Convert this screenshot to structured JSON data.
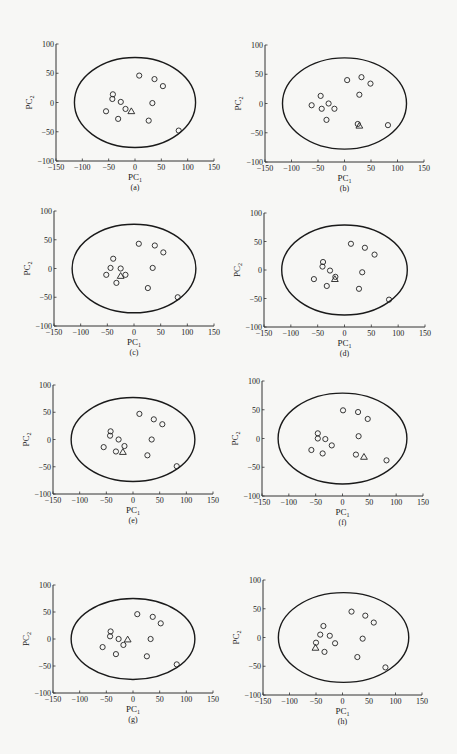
{
  "chart_data": [
    {
      "type": "scatter",
      "panel": "a",
      "caption": "(a)",
      "xlabel": "PC",
      "xlabel_sub": "1",
      "ylabel": "PC",
      "ylabel_sub": "2",
      "xlim": [
        -150,
        150
      ],
      "ylim": [
        -100,
        100
      ],
      "xticks": [
        -150,
        -100,
        -50,
        0,
        50,
        100,
        150
      ],
      "yticks": [
        -100,
        -50,
        0,
        50,
        100
      ],
      "ellipse": {
        "cx": 0,
        "cy": 0,
        "rx": 115,
        "ry": 77
      },
      "series": [
        {
          "name": "circles",
          "marker": "circle",
          "points": [
            [
              8,
              46
            ],
            [
              37,
              40
            ],
            [
              53,
              28
            ],
            [
              -42,
              14
            ],
            [
              -43,
              6
            ],
            [
              -27,
              1
            ],
            [
              33,
              -1
            ],
            [
              -55,
              -15
            ],
            [
              -18,
              -11
            ],
            [
              -32,
              -28
            ],
            [
              26,
              -31
            ],
            [
              83,
              -48
            ]
          ]
        },
        {
          "name": "triangle",
          "marker": "triangle",
          "points": [
            [
              -7,
              -15
            ]
          ]
        }
      ]
    },
    {
      "type": "scatter",
      "panel": "b",
      "caption": "(b)",
      "xlabel": "PC",
      "xlabel_sub": "1",
      "ylabel": "PC",
      "ylabel_sub": "2",
      "xlim": [
        -150,
        150
      ],
      "ylim": [
        -100,
        100
      ],
      "xticks": [
        -150,
        -100,
        -50,
        0,
        50,
        100,
        150
      ],
      "yticks": [
        -100,
        -50,
        0,
        50,
        100
      ],
      "ellipse": {
        "cx": 0,
        "cy": 0,
        "rx": 117,
        "ry": 78
      },
      "series": [
        {
          "name": "circles",
          "marker": "circle",
          "points": [
            [
              5,
              40
            ],
            [
              32,
              45
            ],
            [
              49,
              34
            ],
            [
              -45,
              13
            ],
            [
              28,
              15
            ],
            [
              -62,
              -3
            ],
            [
              -43,
              -9
            ],
            [
              -30,
              0
            ],
            [
              -19,
              -9
            ],
            [
              -34,
              -28
            ],
            [
              25,
              -35
            ],
            [
              82,
              -37
            ]
          ]
        },
        {
          "name": "triangle",
          "marker": "triangle",
          "points": [
            [
              28,
              -38
            ]
          ]
        }
      ]
    },
    {
      "type": "scatter",
      "panel": "c",
      "caption": "(c)",
      "xlabel": "PC",
      "xlabel_sub": "1",
      "ylabel": "PC",
      "ylabel_sub": "2",
      "xlim": [
        -150,
        150
      ],
      "ylim": [
        -100,
        100
      ],
      "xticks": [
        -150,
        -100,
        -50,
        0,
        50,
        100,
        150
      ],
      "yticks": [
        -100,
        -50,
        0,
        50,
        100
      ],
      "ellipse": {
        "cx": 0,
        "cy": 0,
        "rx": 116,
        "ry": 77
      },
      "series": [
        {
          "name": "circles",
          "marker": "circle",
          "points": [
            [
              9,
              43
            ],
            [
              39,
              40
            ],
            [
              55,
              28
            ],
            [
              -39,
              17
            ],
            [
              -44,
              1
            ],
            [
              -25,
              0
            ],
            [
              35,
              1
            ],
            [
              -52,
              -11
            ],
            [
              -16,
              -11
            ],
            [
              -33,
              -25
            ],
            [
              26,
              -34
            ],
            [
              82,
              -50
            ]
          ]
        },
        {
          "name": "triangle",
          "marker": "triangle",
          "points": [
            [
              -25,
              -13
            ]
          ]
        }
      ]
    },
    {
      "type": "scatter",
      "panel": "d",
      "caption": "(d)",
      "xlabel": "PC",
      "xlabel_sub": "1",
      "ylabel": "PC",
      "ylabel_sub": "2",
      "xlim": [
        -150,
        150
      ],
      "ylim": [
        -100,
        100
      ],
      "xticks": [
        -150,
        -100,
        -50,
        0,
        50,
        100,
        150
      ],
      "yticks": [
        -100,
        -50,
        0,
        50,
        100
      ],
      "ellipse": {
        "cx": 0,
        "cy": 0,
        "rx": 117,
        "ry": 79
      },
      "series": [
        {
          "name": "circles",
          "marker": "circle",
          "points": [
            [
              12,
              46
            ],
            [
              38,
              39
            ],
            [
              56,
              27
            ],
            [
              -40,
              14
            ],
            [
              -41,
              6
            ],
            [
              -27,
              -1
            ],
            [
              33,
              -4
            ],
            [
              -57,
              -16
            ],
            [
              -17,
              -12
            ],
            [
              -33,
              -28
            ],
            [
              27,
              -33
            ],
            [
              83,
              -52
            ]
          ]
        },
        {
          "name": "triangle",
          "marker": "triangle",
          "points": [
            [
              -18,
              -16
            ]
          ]
        }
      ]
    },
    {
      "type": "scatter",
      "panel": "e",
      "caption": "(e)",
      "xlabel": "PC",
      "xlabel_sub": "1",
      "ylabel": "PC",
      "ylabel_sub": "2",
      "xlim": [
        -150,
        150
      ],
      "ylim": [
        -100,
        100
      ],
      "xticks": [
        -150,
        -100,
        -50,
        0,
        50,
        100,
        150
      ],
      "yticks": [
        -100,
        -50,
        0,
        50,
        100
      ],
      "ellipse": {
        "cx": 0,
        "cy": 0,
        "rx": 116,
        "ry": 77
      },
      "series": [
        {
          "name": "circles",
          "marker": "circle",
          "points": [
            [
              12,
              47
            ],
            [
              39,
              37
            ],
            [
              55,
              28
            ],
            [
              -42,
              15
            ],
            [
              -43,
              7
            ],
            [
              -27,
              0
            ],
            [
              35,
              0
            ],
            [
              -55,
              -14
            ],
            [
              -16,
              -12
            ],
            [
              -32,
              -22
            ],
            [
              27,
              -29
            ],
            [
              82,
              -49
            ]
          ]
        },
        {
          "name": "triangle",
          "marker": "triangle",
          "points": [
            [
              -19,
              -23
            ]
          ]
        }
      ]
    },
    {
      "type": "scatter",
      "panel": "f",
      "caption": "(f)",
      "xlabel": "PC",
      "xlabel_sub": "1",
      "ylabel": "PC",
      "ylabel_sub": "2",
      "xlim": [
        -150,
        150
      ],
      "ylim": [
        -100,
        100
      ],
      "xticks": [
        -150,
        -100,
        -50,
        0,
        50,
        100,
        150
      ],
      "yticks": [
        -100,
        -50,
        0,
        50,
        100
      ],
      "ellipse": {
        "cx": 0,
        "cy": 0,
        "rx": 120,
        "ry": 79
      },
      "series": [
        {
          "name": "circles",
          "marker": "circle",
          "points": [
            [
              1,
              49
            ],
            [
              29,
              46
            ],
            [
              47,
              34
            ],
            [
              -46,
              9
            ],
            [
              -46,
              0
            ],
            [
              -32,
              -1
            ],
            [
              30,
              4
            ],
            [
              -58,
              -20
            ],
            [
              -20,
              -12
            ],
            [
              -37,
              -26
            ],
            [
              25,
              -28
            ],
            [
              82,
              -38
            ]
          ]
        },
        {
          "name": "triangle",
          "marker": "triangle",
          "points": [
            [
              40,
              -32
            ]
          ]
        }
      ]
    },
    {
      "type": "scatter",
      "panel": "g",
      "caption": "(g)",
      "xlabel": "PC",
      "xlabel_sub": "1",
      "ylabel": "PC",
      "ylabel_sub": "2",
      "xlim": [
        -150,
        150
      ],
      "ylim": [
        -100,
        100
      ],
      "xticks": [
        -150,
        -100,
        -50,
        0,
        50,
        100,
        150
      ],
      "yticks": [
        -100,
        -50,
        0,
        50,
        100
      ],
      "ellipse": {
        "cx": 0,
        "cy": 0,
        "rx": 116,
        "ry": 75
      },
      "series": [
        {
          "name": "circles",
          "marker": "circle",
          "points": [
            [
              8,
              46
            ],
            [
              37,
              41
            ],
            [
              52,
              29
            ],
            [
              -42,
              14
            ],
            [
              -43,
              5
            ],
            [
              -27,
              0
            ],
            [
              33,
              0
            ],
            [
              -57,
              -15
            ],
            [
              -18,
              -11
            ],
            [
              -32,
              -28
            ],
            [
              26,
              -32
            ],
            [
              82,
              -47
            ]
          ]
        },
        {
          "name": "triangle",
          "marker": "triangle",
          "points": [
            [
              -10,
              -1
            ]
          ]
        }
      ]
    },
    {
      "type": "scatter",
      "panel": "h",
      "caption": "(h)",
      "xlabel": "PC",
      "xlabel_sub": "1",
      "ylabel": "PC",
      "ylabel_sub": "2",
      "xlim": [
        -150,
        150
      ],
      "ylim": [
        -100,
        100
      ],
      "xticks": [
        -150,
        -100,
        -50,
        0,
        50,
        100,
        150
      ],
      "yticks": [
        -100,
        -50,
        0,
        50,
        100
      ],
      "ellipse": {
        "cx": 2,
        "cy": 0,
        "rx": 123,
        "ry": 78
      },
      "series": [
        {
          "name": "circles",
          "marker": "circle",
          "points": [
            [
              17,
              45
            ],
            [
              43,
              38
            ],
            [
              59,
              26
            ],
            [
              -36,
              20
            ],
            [
              -42,
              5
            ],
            [
              -24,
              3
            ],
            [
              38,
              -2
            ],
            [
              -50,
              -9
            ],
            [
              -14,
              -10
            ],
            [
              -34,
              -25
            ],
            [
              28,
              -34
            ],
            [
              81,
              -52
            ]
          ]
        },
        {
          "name": "triangle",
          "marker": "triangle",
          "points": [
            [
              -51,
              -18
            ]
          ]
        }
      ]
    }
  ],
  "layout": {
    "panels": [
      {
        "left": 56,
        "right": 214,
        "top": 44,
        "bottom": 161
      },
      {
        "left": 265,
        "right": 424,
        "top": 45,
        "bottom": 162
      },
      {
        "left": 54,
        "right": 214,
        "top": 211,
        "bottom": 326
      },
      {
        "left": 264,
        "right": 425,
        "top": 213,
        "bottom": 327
      },
      {
        "left": 53,
        "right": 213,
        "top": 385,
        "bottom": 494
      },
      {
        "left": 262,
        "right": 423,
        "top": 381,
        "bottom": 496
      },
      {
        "left": 53,
        "right": 213,
        "top": 585,
        "bottom": 693
      },
      {
        "left": 263,
        "right": 422,
        "top": 580,
        "bottom": 695
      }
    ]
  }
}
